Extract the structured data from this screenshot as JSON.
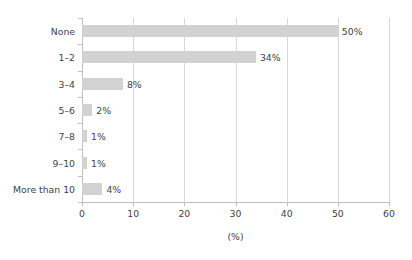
{
  "chart_data": {
    "type": "bar",
    "orientation": "horizontal",
    "title": "",
    "subtitle": "",
    "xlabel": "(%)",
    "ylabel": "",
    "xlim": [
      0,
      60
    ],
    "xticks": [
      0,
      10,
      20,
      30,
      40,
      50,
      60
    ],
    "xtick_labels": [
      "0",
      "10",
      "20",
      "30",
      "40",
      "50",
      "60"
    ],
    "grid": true,
    "grid_axis": "x",
    "legend": false,
    "legend_position": "none",
    "categories": [
      "None",
      "1–2",
      "3–4",
      "5–6",
      "7–8",
      "9–10",
      "More than 10"
    ],
    "values": [
      50,
      34,
      8,
      2,
      1,
      1,
      4
    ],
    "data_labels": [
      "50%",
      "34%",
      "8%",
      "2%",
      "1%",
      "1%",
      "4%"
    ],
    "bar_color": "#d2d2d2",
    "gridline_color": "#d9d9d9",
    "axis_color": "#bfbfbf",
    "text_color": "#3f3f3f",
    "background_color": "#ffffff"
  }
}
